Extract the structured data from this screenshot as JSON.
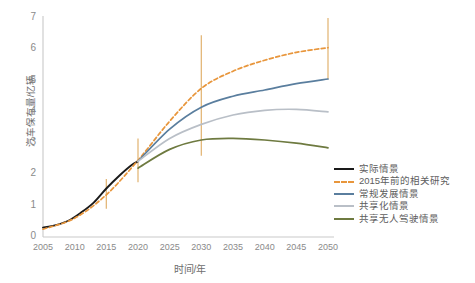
{
  "chart_data": {
    "type": "line",
    "title": "",
    "xlabel": "时间/年",
    "ylabel": "汽车保有量/亿辆",
    "xlim": [
      2005,
      2050
    ],
    "ylim": [
      0,
      7
    ],
    "xticks": [
      2005,
      2010,
      2015,
      2020,
      2025,
      2030,
      2035,
      2040,
      2045,
      2050
    ],
    "yticks": [
      0,
      1,
      2,
      3,
      4,
      5,
      6,
      7
    ],
    "grid": false,
    "legend_position": "right",
    "series": [
      {
        "name": "实际情景",
        "color": "#1a1a1a",
        "style": "solid",
        "x": [
          2005,
          2007,
          2009,
          2011,
          2013,
          2015,
          2017,
          2019,
          2020
        ],
        "values": [
          0.3,
          0.38,
          0.52,
          0.78,
          1.1,
          1.55,
          1.95,
          2.3,
          2.42
        ]
      },
      {
        "name": "2015年前的相关研究",
        "color": "#E8963C",
        "style": "dashed",
        "x": [
          2005,
          2010,
          2015,
          2020,
          2025,
          2030,
          2035,
          2040,
          2045,
          2050
        ],
        "values": [
          0.25,
          0.6,
          1.35,
          2.45,
          3.7,
          4.75,
          5.3,
          5.65,
          5.9,
          6.05
        ]
      },
      {
        "name": "常规发展情景",
        "color": "#5A7E9E",
        "style": "solid",
        "x": [
          2020,
          2025,
          2030,
          2035,
          2040,
          2045,
          2050
        ],
        "values": [
          2.42,
          3.45,
          4.15,
          4.5,
          4.7,
          4.9,
          5.05
        ]
      },
      {
        "name": "共享化情景",
        "color": "#B9BFC7",
        "style": "solid",
        "x": [
          2020,
          2025,
          2030,
          2035,
          2040,
          2045,
          2050
        ],
        "values": [
          2.42,
          3.15,
          3.6,
          3.9,
          4.05,
          4.08,
          4.0
        ]
      },
      {
        "name": "共享无人驾驶情景",
        "color": "#6E7A40",
        "style": "solid",
        "x": [
          2020,
          2025,
          2030,
          2035,
          2040,
          2045,
          2050
        ],
        "values": [
          2.2,
          2.8,
          3.1,
          3.15,
          3.1,
          3.0,
          2.85
        ]
      }
    ],
    "error_bars": {
      "color": "#E4B87A",
      "points": [
        {
          "x": 2015,
          "low": 0.9,
          "high": 1.85
        },
        {
          "x": 2020,
          "low": 1.75,
          "high": 3.15
        },
        {
          "x": 2030,
          "low": 2.6,
          "high": 6.45
        },
        {
          "x": 2050,
          "low": 5.05,
          "high": 7.0
        }
      ]
    }
  },
  "axes": {
    "y_title": "汽车保有量/亿辆",
    "x_title": "时间/年",
    "y_tick_labels": [
      "7",
      "6",
      "5",
      "4",
      "3",
      "2",
      "1",
      "0"
    ],
    "x_tick_labels": [
      "2005",
      "2010",
      "2015",
      "2020",
      "2025",
      "2030",
      "2035",
      "2040",
      "2045",
      "2050"
    ]
  },
  "legend": {
    "items": [
      {
        "label": "实际情景",
        "color": "#1a1a1a",
        "dashed": false
      },
      {
        "label": "2015年前的相关研究",
        "color": "#E8963C",
        "dashed": true
      },
      {
        "label": "常规发展情景",
        "color": "#5A7E9E",
        "dashed": false
      },
      {
        "label": "共享化情景",
        "color": "#B9BFC7",
        "dashed": false
      },
      {
        "label": "共享无人驾驶情景",
        "color": "#6E7A40",
        "dashed": false
      }
    ]
  }
}
